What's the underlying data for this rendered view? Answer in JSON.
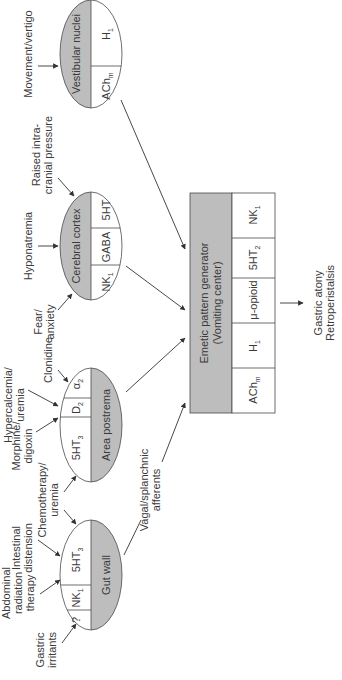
{
  "diagram": {
    "orientation": "rotated-90-ccw",
    "colors": {
      "shade": "#bdbdbd",
      "stroke": "#4a4a4a",
      "text": "#3a3a3a"
    },
    "nodes": {
      "vestibular": {
        "name": "Vestibular nuclei",
        "receptors": [
          {
            "base": "H",
            "sub": "1"
          },
          {
            "base": "ACh",
            "sub": "m"
          }
        ],
        "inputs": [
          "Movement/vertigo"
        ]
      },
      "cortex": {
        "name": "Cerebral cortex",
        "receptors": [
          {
            "base": "5HT",
            "sub": ""
          },
          {
            "base": "GABA",
            "sub": ""
          },
          {
            "base": "NK",
            "sub": "1"
          }
        ],
        "inputs": [
          "Raised intra-",
          "cranial pressure",
          "Hyponatremia",
          "Fear/",
          "anxiety"
        ]
      },
      "postrema": {
        "name": "Area postrema",
        "receptors": [
          {
            "base": "α",
            "sub": "2"
          },
          {
            "base": "D",
            "sub": "2"
          },
          {
            "base": "5HT",
            "sub": "3"
          }
        ],
        "inputs": [
          "Clonidine",
          "Hypercalcemia/",
          "uremia",
          "Morphine/",
          "digoxin",
          "Chemotherapy/",
          "uremia"
        ]
      },
      "gut": {
        "name": "Gut wall",
        "receptors": [
          {
            "base": "5HT",
            "sub": "3"
          },
          {
            "base": "NK",
            "sub": "1"
          },
          {
            "base": "?",
            "sub": ""
          }
        ],
        "inputs": [
          "Intestinal",
          "distension",
          "Abdominal",
          "radiation",
          "therapy",
          "Gastric",
          "irritants"
        ]
      },
      "emetic": {
        "name_line1": "Emetic pattern generator",
        "name_line2": "(Vomiting center)",
        "receptors": [
          {
            "base": "NK",
            "sub": "1"
          },
          {
            "base": "5HT",
            "sub": "2"
          },
          {
            "base": "μ-opioid",
            "sub": ""
          },
          {
            "base": "H",
            "sub": "1"
          },
          {
            "base": "ACh",
            "sub": "m"
          }
        ]
      }
    },
    "edge_labels": {
      "vagal_1": "Vagal/splanchnic",
      "vagal_2": "afferents"
    },
    "output": {
      "line1": "Gastric atony",
      "line2": "Retroperistalsis"
    }
  }
}
